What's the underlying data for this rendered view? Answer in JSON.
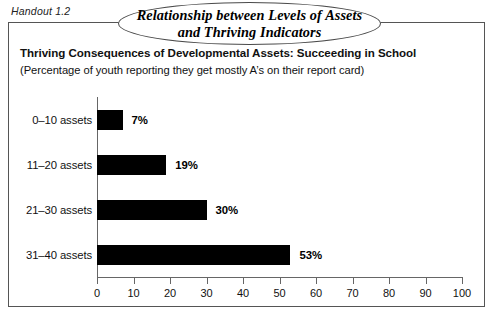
{
  "handout": {
    "label": "Handout 1.2"
  },
  "title": {
    "line1": "Relationship between Levels of Assets",
    "line2": "and Thriving Indicators"
  },
  "heading": {
    "main": "Thriving Consequences of Developmental Assets: Succeeding in School",
    "sub": "(Percentage of youth reporting they get mostly A’s on their report card)"
  },
  "chart_data": {
    "type": "bar",
    "orientation": "horizontal",
    "title": "Thriving Consequences of Developmental Assets: Succeeding in School",
    "subtitle": "(Percentage of youth reporting they get mostly A’s on their report card)",
    "categories": [
      "0–10 assets",
      "11–20 assets",
      "21–30 assets",
      "31–40 assets"
    ],
    "values": [
      7,
      19,
      30,
      53
    ],
    "value_labels": [
      "7%",
      "19%",
      "30%",
      "53%"
    ],
    "xlabel": "",
    "ylabel": "",
    "xlim": [
      0,
      100
    ],
    "xticks": [
      0,
      10,
      20,
      30,
      40,
      50,
      60,
      70,
      80,
      90,
      100
    ],
    "xtick_labels": [
      "0",
      "10",
      "20",
      "30",
      "40",
      "50",
      "60",
      "70",
      "80",
      "90",
      "100"
    ],
    "grid": false,
    "legend": false,
    "bar_color": "#000000",
    "axis_color": "#666666"
  }
}
